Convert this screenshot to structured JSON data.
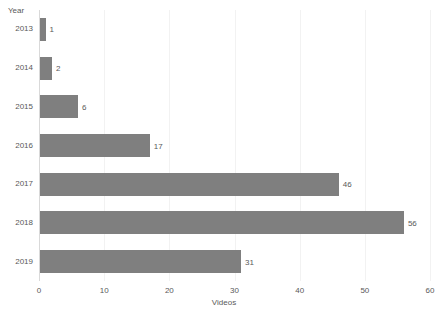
{
  "chart_data": {
    "type": "bar",
    "orientation": "horizontal",
    "title": "",
    "xlabel": "Videos",
    "ylabel": "Year",
    "categories": [
      "2013",
      "2014",
      "2015",
      "2016",
      "2017",
      "2018",
      "2019"
    ],
    "values": [
      1,
      2,
      6,
      17,
      46,
      56,
      31
    ],
    "data_labels": [
      "1",
      "2",
      "6",
      "17",
      "46",
      "56",
      "31"
    ],
    "xlim": [
      0,
      60
    ],
    "xticks": [
      0,
      10,
      20,
      30,
      40,
      50,
      60
    ],
    "xtick_labels": [
      "0",
      "10",
      "20",
      "30",
      "40",
      "50",
      "60"
    ],
    "grid": "vertical-major",
    "legend": "none",
    "series": [
      {
        "name": "Videos",
        "values": [
          1,
          2,
          6,
          17,
          46,
          56,
          31
        ]
      }
    ],
    "colors": {
      "bar": "#7f7f7f",
      "gridline": "#f2f2f2",
      "axis": "#d9d9d9",
      "text": "#595959",
      "background": "#ffffff"
    }
  }
}
